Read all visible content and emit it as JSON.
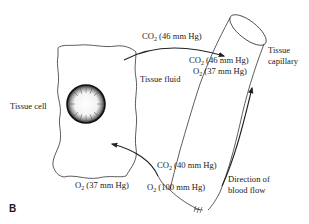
{
  "figure": {
    "panel_label": "B",
    "colors": {
      "line": "#222222",
      "text": "#1a1a1a",
      "background": "#ffffff"
    }
  },
  "structures": {
    "tissue_cell": "Tissue cell",
    "tissue_fluid": "Tissue fluid",
    "tissue_capillary_line1": "Tissue",
    "tissue_capillary_line2": "capillary",
    "blood_flow_line1": "Direction of",
    "blood_flow_line2": "blood flow"
  },
  "gases": {
    "co2_diffusing": {
      "gas": "CO",
      "sub": "2",
      "value": " (46 mm Hg)"
    },
    "co2_venous": {
      "gas": "CO",
      "sub": "2",
      "value": " (46 mm Hg)"
    },
    "o2_venous": {
      "gas": "O",
      "sub": "2",
      "value": " (37 mm Hg)"
    },
    "co2_arterial": {
      "gas": "CO",
      "sub": "2",
      "value": " (40 mm Hg)"
    },
    "o2_arterial": {
      "gas": "O",
      "sub": "2",
      "value": " (100 mm Hg)"
    },
    "o2_cell": {
      "gas": "O",
      "sub": "2",
      "value": " (37 mm Hg)"
    }
  }
}
